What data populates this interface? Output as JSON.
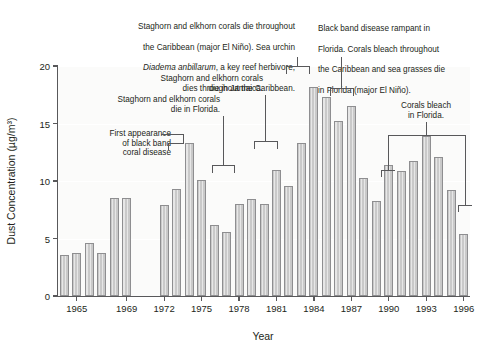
{
  "chart_data": {
    "type": "bar",
    "title": "",
    "xlabel": "Year",
    "ylabel": "Dust Concentration (µg/m³)",
    "ylim": [
      0,
      20
    ],
    "yticks": [
      0,
      5,
      10,
      15,
      20
    ],
    "xticks": [
      1965,
      1969,
      1972,
      1975,
      1978,
      1981,
      1984,
      1987,
      1990,
      1993,
      1996
    ],
    "grid": true,
    "legend": "none",
    "categories": [
      1964,
      1965,
      1966,
      1967,
      1968,
      1969,
      1972,
      1973,
      1974,
      1975,
      1976,
      1977,
      1978,
      1979,
      1980,
      1981,
      1982,
      1983,
      1984,
      1985,
      1986,
      1987,
      1988,
      1989,
      1990,
      1991,
      1992,
      1993,
      1994,
      1995,
      1996
    ],
    "values": [
      3.6,
      3.7,
      4.6,
      3.7,
      8.5,
      8.5,
      7.9,
      9.3,
      13.3,
      10.1,
      6.2,
      5.6,
      8.0,
      8.4,
      8.0,
      11.0,
      9.6,
      13.3,
      18.2,
      17.3,
      15.2,
      16.5,
      10.3,
      8.3,
      11.4,
      10.9,
      11.7,
      13.9,
      12.1,
      9.2,
      5.4
    ],
    "bar_color": "#c9c9c9",
    "bar_edge_color": "#8e8e90",
    "annotations": [
      {
        "id": "first-appearance",
        "text": "First appearance\nof black band\ncoral disease",
        "target_year": 1973
      },
      {
        "id": "staghorn-florida",
        "text": "Staghorn and elkhorn corals\ndie in Florida.",
        "target_years": [
          1978,
          1980
        ]
      },
      {
        "id": "staghorn-jamaica",
        "text": "Staghorn and elkhorn corals\ndie in Jamaica.",
        "target_year": 1980
      },
      {
        "id": "staghorn-caribbean",
        "text_lines": [
          "Staghorn and elkhorn corals die throughout",
          "the Caribbean (major El Niño). Sea urchin",
          "Diadema anbillarum, a key reef herbivore,",
          "dies throughout the Caribbean."
        ],
        "italic_part": "Diadema anbillarum",
        "target_years": [
          1983,
          1984
        ]
      },
      {
        "id": "black-band-rampant",
        "text_lines": [
          "Black band disease rampant in",
          "Florida. Corals bleach throughout",
          "the Caribbean and sea grasses die",
          "in Florida (major El Niño)."
        ],
        "target_years": [
          1986,
          1987
        ]
      },
      {
        "id": "corals-bleach-florida",
        "text": "Corals bleach\nin Florida.",
        "target_years": [
          1990,
          1995
        ]
      }
    ],
    "gap_note": "No data bars shown for 1970 and 1971"
  },
  "axis": {
    "y_label": "Dust Concentration (µg/m³)",
    "x_label": "Year",
    "y_ticks": [
      "0",
      "5",
      "10",
      "15",
      "20"
    ],
    "x_ticks": [
      "1965",
      "1969",
      "1972",
      "1975",
      "1978",
      "1981",
      "1984",
      "1987",
      "1990",
      "1993",
      "1996"
    ]
  },
  "annotations": {
    "first_appearance": "First appearance\nof black band\ncoral disease",
    "staghorn_florida": "Staghorn and elkhorn corals\ndie in Florida.",
    "staghorn_jamaica": "Staghorn and elkhorn corals\ndie in Jamaica.",
    "caribbean_l1": "Staghorn and elkhorn corals die throughout",
    "caribbean_l2": "the Caribbean (major El Niño). Sea urchin",
    "caribbean_l3a": "Diadema anbillarum",
    "caribbean_l3b": ", a key reef herbivore,",
    "caribbean_l4": "dies throughout the Caribbean.",
    "blackband_l1": "Black band disease rampant in",
    "blackband_l2": "Florida. Corals bleach throughout",
    "blackband_l3": "the Caribbean and sea grasses die",
    "blackband_l4": "in Florida (major El Niño).",
    "corals_bleach_florida": "Corals bleach\nin Florida."
  }
}
